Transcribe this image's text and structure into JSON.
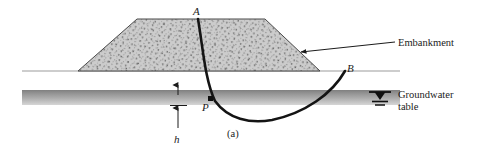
{
  "figure": {
    "caption": "(a)",
    "domain": "geotechnical-slope-stability",
    "background_color": "#ffffff",
    "line_color": "#1b1b1b",
    "fill_color": "#c9c9c9",
    "groundwater_band_color": "#9a9a9a"
  },
  "labels": {
    "point_a": "A",
    "point_b": "B",
    "point_p": "P",
    "depth_h": "h",
    "embankment": "Embankment",
    "groundwater_line1": "Groundwater",
    "groundwater_line2": "table"
  },
  "geometry": {
    "ground_line": {
      "x1": 22,
      "y1": 71,
      "x2": 400,
      "y2": 71
    },
    "embankment": {
      "crest_left_x": 137,
      "crest_right_x": 265,
      "crest_y": 19,
      "toe_left_x": 78,
      "toe_right_x": 320,
      "base_y": 71
    },
    "groundwater_band": {
      "x": 22,
      "y_top": 90,
      "y_bottom": 105,
      "x2": 400
    },
    "slip_circle": {
      "start": {
        "x": 198,
        "y": 19,
        "label": "A"
      },
      "through": {
        "x": 210,
        "y": 100,
        "label": "P"
      },
      "bottom": {
        "x": 268,
        "y": 122
      },
      "end": {
        "x": 345,
        "y": 71,
        "label": "B"
      }
    },
    "depth_dimension": {
      "x": 178,
      "top_arrow_y": 86,
      "tick_y": 105,
      "bottom_arrow_y": 120,
      "label_y": 133
    },
    "water_table_symbol": {
      "x": 380,
      "y": 96
    },
    "embankment_leader": {
      "from_x": 396,
      "from_y": 42,
      "to_x": 300,
      "to_y": 52
    }
  }
}
